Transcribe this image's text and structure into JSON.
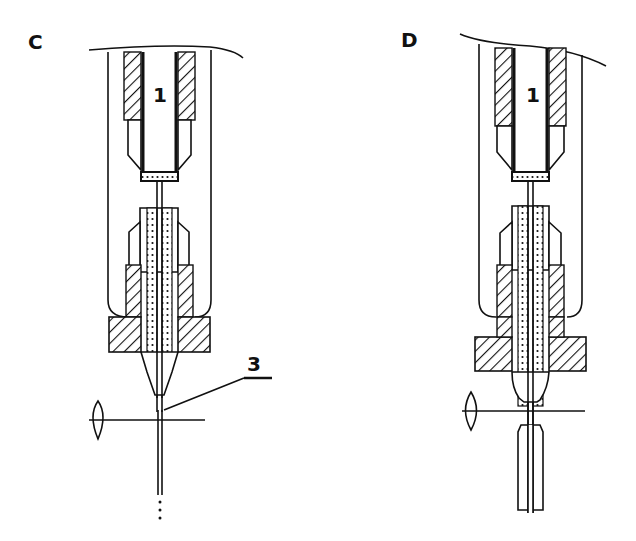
{
  "figure": {
    "panels": [
      {
        "id": "C",
        "label": "C",
        "part_labels": {
          "capillary": "1",
          "tip": "3"
        },
        "description": "Capillary column fitting with tapered tip; fine fiber/stream exits below, passing optical lens axis, continuing with dotted ellipsis"
      },
      {
        "id": "D",
        "label": "D",
        "part_labels": {
          "capillary": "1"
        },
        "description": "Same capillary column fitting; packed segment below lens axis continues downward"
      }
    ]
  }
}
